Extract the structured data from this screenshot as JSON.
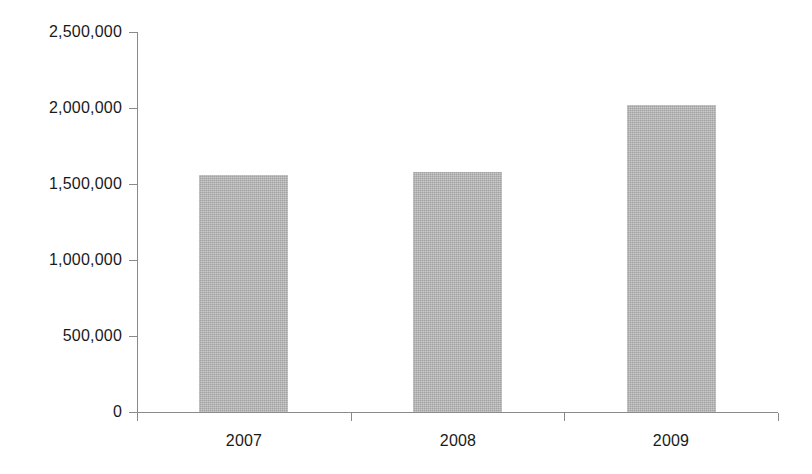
{
  "chart_data": {
    "type": "bar",
    "title": "",
    "subtitle": "",
    "xlabel": "",
    "ylabel": "",
    "categories": [
      "2007",
      "2008",
      "2009"
    ],
    "values": [
      1560000,
      1580000,
      2020000
    ],
    "series": [
      {
        "name": "",
        "values": [
          1560000,
          1580000,
          2020000
        ]
      }
    ],
    "ylim": [
      0,
      2500000
    ],
    "y_ticks": [
      0,
      500000,
      1000000,
      1500000,
      2000000,
      2500000
    ],
    "y_tick_labels": [
      "0",
      "500,000",
      "1,000,000",
      "1,500,000",
      "2,000,000",
      "2,500,000"
    ],
    "x_tick_labels": [
      "2007",
      "2008",
      "2009"
    ],
    "grid": false,
    "legend": false,
    "legend_position": "none",
    "bar_color": "#b4b4b4",
    "axis_color": "#8a8a8a",
    "text_color": "#1a1a1a",
    "background_color": "#ffffff"
  }
}
